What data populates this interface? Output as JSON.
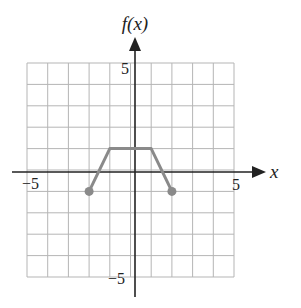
{
  "chart_data": {
    "type": "line",
    "title": "",
    "xlabel": "x",
    "ylabel": "f(x)",
    "xlim": [
      -5,
      5
    ],
    "ylim": [
      -5,
      5
    ],
    "grid": true,
    "x_tick_labels": [
      "-5",
      "5"
    ],
    "y_tick_labels": [
      "5",
      "-5"
    ],
    "series": [
      {
        "name": "f(x)",
        "points": [
          [
            -2,
            -1
          ],
          [
            -1,
            1
          ],
          [
            1,
            1
          ],
          [
            2,
            -1
          ]
        ],
        "endpoints": [
          [
            -2,
            -1
          ],
          [
            2,
            -1
          ]
        ],
        "endpoint_style": "closed",
        "color": "#8a8a8a"
      }
    ]
  },
  "labels": {
    "y_axis": "f(x)",
    "x_axis": "x",
    "x_min": "−5",
    "x_max": "5",
    "y_max": "5",
    "y_min": "−5"
  },
  "colors": {
    "grid": "#b5b5b5",
    "axis": "#222222",
    "curve": "#8a8a8a"
  }
}
